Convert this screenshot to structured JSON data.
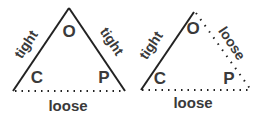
{
  "diagrams": [
    {
      "vertices": {
        "top": "O",
        "left": "C",
        "right": "P"
      },
      "edges": {
        "left": "tight",
        "right": "tight",
        "bottom": "loose"
      },
      "styles": {
        "left": "solid",
        "right": "solid",
        "bottom": "dotted"
      }
    },
    {
      "vertices": {
        "top": "O",
        "left": "C",
        "right": "P"
      },
      "edges": {
        "left": "tight",
        "right": "loose",
        "bottom": "loose"
      },
      "styles": {
        "left": "solid",
        "right": "dotted",
        "bottom": "dotted"
      }
    }
  ],
  "colors": {
    "line": "#222222",
    "text": "#3a3a3a"
  }
}
